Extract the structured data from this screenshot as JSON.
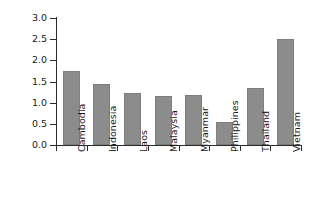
{
  "chart_data": {
    "type": "bar",
    "title": "",
    "xlabel": "",
    "ylabel": "Poverty reduction",
    "categories": [
      "Cambodia",
      "Indonesia",
      "Laos",
      "Malaysia",
      "Myanmar",
      "Philippines",
      "Thailand",
      "Vietnam"
    ],
    "values": [
      1.75,
      1.43,
      1.22,
      1.16,
      1.18,
      0.54,
      1.35,
      2.5
    ],
    "ylim": [
      0.0,
      3.0
    ],
    "ytick_labels": [
      "0.0",
      "0.5",
      "1.0",
      "1.5",
      "2.0",
      "2.5",
      "3.0"
    ],
    "ytick_values": [
      0.0,
      0.5,
      1.0,
      1.5,
      2.0,
      2.5,
      3.0
    ],
    "grid": false,
    "legend": false,
    "legend_position": "none",
    "bar_color": "#8c8c8c",
    "axis_color": "#2b2b2b",
    "background_color": "#ffffff"
  }
}
